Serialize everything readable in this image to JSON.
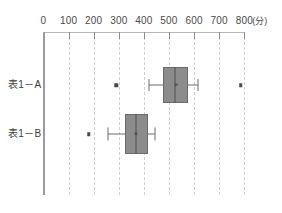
{
  "chart_data": {
    "type": "box",
    "title": "",
    "xlabel": "",
    "ylabel": "",
    "unit_label": "(分)",
    "xlim": [
      0,
      800
    ],
    "grid": true,
    "grid_orientation": "vertical",
    "grid_style": "dashed",
    "legend": "none",
    "x_ticks": [
      0,
      100,
      200,
      300,
      400,
      500,
      600,
      700,
      800
    ],
    "x_tick_labels": [
      "0",
      "100",
      "200",
      "300",
      "400",
      "500",
      "600",
      "700",
      "800"
    ],
    "categories": [
      "表1－A",
      "表1－B"
    ],
    "series": [
      {
        "name": "表1－A",
        "whisker_low": 420,
        "q1": 475,
        "median": 525,
        "mean": 528,
        "q3": 575,
        "whisker_high": 615,
        "outliers": [
          290,
          785
        ]
      },
      {
        "name": "表1－B",
        "whisker_low": 255,
        "q1": 325,
        "median": 370,
        "mean": 368,
        "q3": 415,
        "whisker_high": 445,
        "outliers": [
          180
        ]
      }
    ]
  },
  "style": {
    "box_fill": "#8c8c8c",
    "box_stroke": "#6a6a6a",
    "median_color": "#4f4f4f",
    "whisker_color": "#6e6e6e",
    "outlier_color": "#4a4a4a",
    "grid_color": "#cfcfcf",
    "axis_color": "#9a9a9a",
    "text_color": "#4a4a4a",
    "background": "#ffffff"
  },
  "axis": {
    "unit": "(分)"
  },
  "marks": {
    "mean_glyph": "×"
  }
}
